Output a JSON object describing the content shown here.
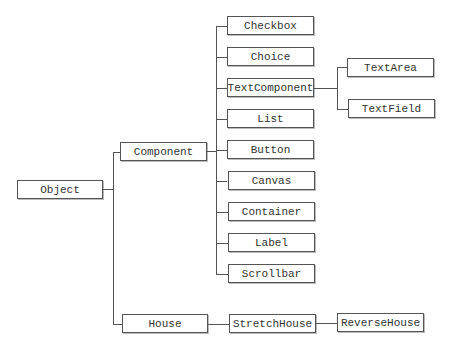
{
  "diagram": {
    "type": "class-hierarchy-tree",
    "root": "Object",
    "nodes": {
      "object": "Object",
      "component": "Component",
      "house": "House",
      "checkbox": "Checkbox",
      "choice": "Choice",
      "text_component": "TextComponent",
      "list": "List",
      "button": "Button",
      "canvas": "Canvas",
      "container": "Container",
      "label": "Label",
      "scrollbar": "Scrollbar",
      "text_area": "TextArea",
      "text_field": "TextField",
      "stretch_house": "StretchHouse",
      "reverse_house": "ReverseHouse"
    },
    "edges": [
      [
        "Object",
        "Component"
      ],
      [
        "Object",
        "House"
      ],
      [
        "Component",
        "Checkbox"
      ],
      [
        "Component",
        "Choice"
      ],
      [
        "Component",
        "TextComponent"
      ],
      [
        "Component",
        "List"
      ],
      [
        "Component",
        "Button"
      ],
      [
        "Component",
        "Canvas"
      ],
      [
        "Component",
        "Container"
      ],
      [
        "Component",
        "Label"
      ],
      [
        "Component",
        "Scrollbar"
      ],
      [
        "TextComponent",
        "TextArea"
      ],
      [
        "TextComponent",
        "TextField"
      ],
      [
        "House",
        "StretchHouse"
      ],
      [
        "StretchHouse",
        "ReverseHouse"
      ]
    ]
  }
}
